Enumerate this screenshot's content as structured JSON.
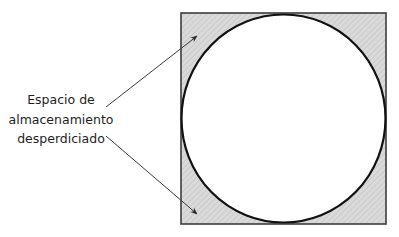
{
  "diagram": {
    "label": {
      "lines": [
        "Espacio de",
        "almacenamiento",
        "desperdiciado"
      ]
    },
    "shapes": {
      "square": {
        "x": 181,
        "y": 13,
        "width": 205,
        "height": 211,
        "fill": "#d9d9d9",
        "hatch": "#c4c4c4",
        "stroke": "#444444"
      },
      "circle": {
        "cx": 283.5,
        "cy": 118.5,
        "rx": 102,
        "ry": 104,
        "fill": "#ffffff",
        "stroke": "#111111"
      }
    },
    "arrows": [
      {
        "name": "arrow-to-top-left-corner",
        "x1": 106,
        "y1": 107,
        "x2": 197,
        "y2": 36
      },
      {
        "name": "arrow-to-bottom-left-corner",
        "x1": 106,
        "y1": 136,
        "x2": 197,
        "y2": 214
      }
    ]
  }
}
